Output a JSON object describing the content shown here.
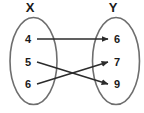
{
  "figure": {
    "type": "mapping-diagram",
    "background_color": "#ffffff",
    "ellipse_stroke": "#6e6e6e",
    "ink_color": "#1a1a1a"
  },
  "sets": {
    "domain": {
      "label": "X",
      "elements": [
        {
          "value": "4"
        },
        {
          "value": "5"
        },
        {
          "value": "6"
        }
      ]
    },
    "codomain": {
      "label": "Y",
      "elements": [
        {
          "value": "6"
        },
        {
          "value": "7"
        },
        {
          "value": "9"
        }
      ]
    }
  },
  "mappings": [
    {
      "from": "4",
      "to": "6"
    },
    {
      "from": "5",
      "to": "9"
    },
    {
      "from": "6",
      "to": "7"
    }
  ]
}
